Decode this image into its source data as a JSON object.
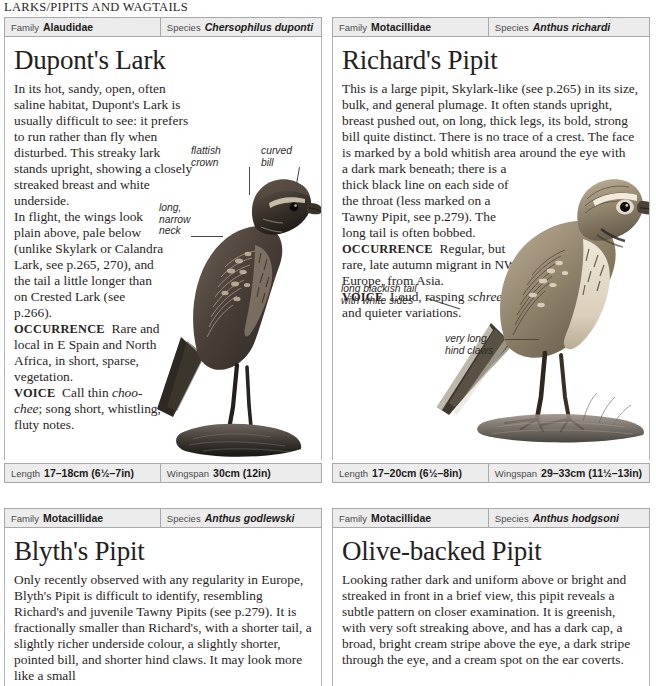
{
  "running_head": "LARKS/PIPITS AND WAGTAILS",
  "labels": {
    "family": "Family",
    "species": "Species",
    "length": "Length",
    "wingspan": "Wingspan"
  },
  "panels": [
    {
      "id": "duponts-lark",
      "family": "Alaudidae",
      "species_latin": "Chersophilus duponti",
      "title": "Dupont's Lark",
      "text_full": "In its hot, sandy, open, often saline habitat, Dupont's Lark is usually difficult to see: it prefers to run rather than fly when disturbed. This streaky lark stands upright, showing a closely streaked breast and white underside.",
      "text_narrow": "In flight, the wings look plain above, pale below (unlike Skylark or Calandra Lark, see p.265, 270), and the tail a little longer than on Crested Lark (see p.266).",
      "occurrence_lead": "OCCURRENCE",
      "occurrence": "Rare and local in E Spain and North Africa, in short, sparse, vegetation.",
      "voice_lead": "VOICE",
      "voice_pre": "Call thin",
      "voice_italic": "choo-chee",
      "voice_post": "; song short, whistling, fluty notes.",
      "length": "17–18cm (6½–7in)",
      "wingspan": "30cm (12in)",
      "callouts": [
        {
          "text": "flattish\ncrown"
        },
        {
          "text": "curved\nbill"
        },
        {
          "text": "long,\nnarrow\nneck"
        }
      ]
    },
    {
      "id": "richards-pipit",
      "family": "Motacillidae",
      "species_latin": "Anthus richardi",
      "title": "Richard's Pipit",
      "text_full": "This is a large pipit, Skylark-like (see p.265) in its size, bulk, and general plumage. It often stands upright, breast pushed out, on long, thick legs, its bold, strong bill quite distinct. There is no trace of a crest. The face is marked by a bold whitish area around the eye with",
      "text_narrow": "a dark mark beneath; there is a thick black line on each side of the throat (less marked on a Tawny Pipit, see p.279). The long tail is often bobbed.",
      "occurrence_lead": "OCCURRENCE",
      "occurrence": "Regular, but rare, late autumn migrant in NW Europe, from Asia.",
      "voice_lead": "VOICE",
      "voice_pre": "Loud, rasping",
      "voice_italic": "schreep",
      "voice_post": " and quieter variations.",
      "length": "17–20cm (6½–8in)",
      "wingspan": "29–33cm (11½–13in)",
      "callouts": [
        {
          "text": "long blackish tail\nwith white sides"
        },
        {
          "text": "very long\nhind claws"
        }
      ]
    },
    {
      "id": "blyths-pipit",
      "family": "Motacillidae",
      "species_latin": "Anthus godlewski",
      "title": "Blyth's Pipit",
      "text_full": "Only recently observed with any regularity in Europe, Blyth's Pipit is difficult to identify, resembling Richard's and juvenile Tawny Pipits (see p.279). It is fractionally smaller than Richard's, with a shorter tail, a slightly richer underside colour, a slightly shorter, pointed bill, and shorter hind claws. It may look more like a small",
      "callouts": []
    },
    {
      "id": "olive-backed-pipit",
      "family": "Motacillidae",
      "species_latin": "Anthus hodgsoni",
      "title": "Olive-backed Pipit",
      "text_full": "Looking rather dark and uniform above or bright and streaked in front in a brief view, this pipit reveals a subtle pattern on closer examination. It is greenish, with very soft streaking above, and has a dark cap, a broad, bright cream stripe above the eye, a dark stripe through the eye, and a cream spot on the ear coverts.",
      "callouts": []
    }
  ],
  "colors": {
    "header_fill": "#ececec",
    "header_border": "#a9a9a9",
    "panel_border": "#b6b6b6",
    "text": "#2a2523",
    "title": "#232020"
  }
}
